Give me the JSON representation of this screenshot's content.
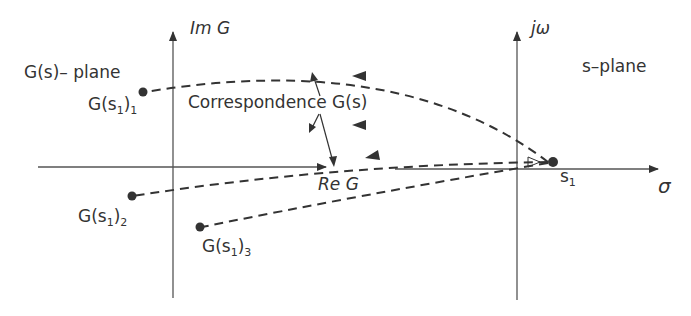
{
  "diagram": {
    "left_plane": {
      "title": "G(s)– plane",
      "axes": {
        "imaginary": "Im G",
        "real": "Re G"
      },
      "points": [
        {
          "label": "G(s",
          "sub1": "1",
          "close": ")",
          "sub2": "1"
        },
        {
          "label": "G(s",
          "sub1": "1",
          "close": ")",
          "sub2": "2"
        },
        {
          "label": "G(s",
          "sub1": "1",
          "close": ")",
          "sub2": "3"
        }
      ]
    },
    "right_plane": {
      "title": "s–plane",
      "axes": {
        "imaginary": "jω",
        "real": "σ"
      },
      "point": {
        "label": "s",
        "sub": "1"
      }
    },
    "mapping_label": "Correspondence G(s)",
    "colors": {
      "ink": "#333333",
      "background": "#ffffff"
    }
  }
}
